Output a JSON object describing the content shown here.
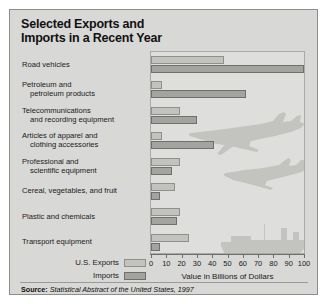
{
  "title": {
    "line1": "Selected Exports and",
    "line2": "Imports in a Recent Year"
  },
  "legend": {
    "exports_label": "U.S. Exports",
    "imports_label": "Imports",
    "exports_color": "#c2c2bf",
    "imports_color": "#a3a3a0"
  },
  "source": {
    "prefix": "Source:",
    "text": "Statistical Abstract of the United States, 1997"
  },
  "chart_data": {
    "type": "bar",
    "orientation": "horizontal",
    "title": "Selected Exports and Imports in a Recent Year",
    "xlabel": "Value in Billions of Dollars",
    "ylabel": "",
    "xlim": [
      0,
      100
    ],
    "xticks": [
      0,
      10,
      20,
      30,
      40,
      50,
      60,
      70,
      80,
      90,
      100
    ],
    "xtick_labels": [
      "0",
      "10",
      "20",
      "30",
      "40",
      "50",
      "60",
      "70",
      "80",
      "90",
      "100"
    ],
    "grid": false,
    "legend_position": "bottom-left-outside",
    "categories": [
      "Road vehicles",
      "Petroleum and petroleum products",
      "Telecommunications and recording equipment",
      "Articles of apparel and clothing accessories",
      "Professional and scientific equipment",
      "Cereal, vegetables, and fruit",
      "Plastic and chemicals",
      "Transport equipment"
    ],
    "category_lines": [
      [
        "Road vehicles"
      ],
      [
        "Petroleum and",
        "petroleum products"
      ],
      [
        "Telecommunications",
        "and recording equipment"
      ],
      [
        "Articles of apparel and",
        "clothing accessories"
      ],
      [
        "Professional and",
        "scientific equipment"
      ],
      [
        "Cereal, vegetables, and fruit"
      ],
      [
        "Plastic and chemicals"
      ],
      [
        "Transport equipment"
      ]
    ],
    "series": [
      {
        "name": "U.S. Exports",
        "color": "#c2c2bf",
        "values": [
          48,
          7,
          19,
          7,
          19,
          16,
          19,
          25
        ]
      },
      {
        "name": "Imports",
        "color": "#a3a3a0",
        "values": [
          100,
          62,
          30,
          41,
          14,
          6,
          17,
          6
        ]
      }
    ],
    "annotations": [
      "airplane silhouette",
      "airplane silhouette",
      "cargo ship silhouette"
    ]
  }
}
